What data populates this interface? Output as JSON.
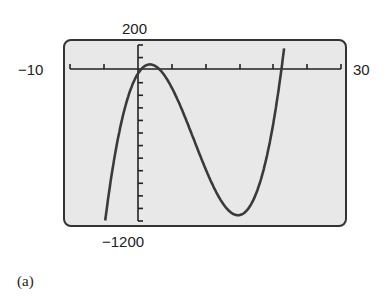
{
  "window": {
    "ymax_label": "200",
    "ymin_label": "−1200",
    "xmin_label": "−10",
    "xmax_label": "30",
    "caption": "(a)"
  },
  "colors": {
    "screen_bg": "#e8e8e8",
    "frame": "#333333",
    "curve": "#3a3a3a",
    "axis": "#222222"
  },
  "chart_data": {
    "type": "line",
    "title": "",
    "xlabel": "",
    "ylabel": "",
    "xlim": [
      -10,
      30
    ],
    "ylim": [
      -1200,
      200
    ],
    "xscale_tick": 5,
    "yscale_tick": 100,
    "grid": false,
    "legend": null,
    "tick_labels": {
      "xmin": "-10",
      "xmax": "30",
      "ymin": "-1200",
      "ymax": "200"
    },
    "series": [
      {
        "name": "cubic",
        "x": [
          -5.2,
          -4,
          -3,
          -2,
          -1,
          0,
          1,
          1.8,
          3,
          5,
          7,
          9,
          11,
          13,
          14.8,
          16,
          18,
          20,
          21.7,
          22.3
        ],
        "y": [
          -1200,
          -793,
          -528,
          -323,
          -171,
          -30,
          29,
          45,
          25,
          -92,
          -289,
          -522,
          -757,
          -952,
          -1060,
          -1036,
          -851,
          -450,
          0,
          200
        ]
      }
    ],
    "features": {
      "local_max": [
        1.8,
        45
      ],
      "local_min": [
        14.8,
        -1060
      ],
      "x_intercepts": [
        -0.3,
        21.7
      ]
    },
    "caption": "(a)"
  }
}
